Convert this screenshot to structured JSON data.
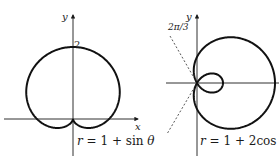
{
  "chart_data": [
    {
      "type": "line",
      "kind": "polar-curve",
      "title": "r = 1 + sin θ",
      "equation": "r = 1 + sin θ",
      "xlabel": "x",
      "ylabel": "y",
      "annotations": [
        {
          "text": "2",
          "at": [
            0,
            2
          ]
        }
      ],
      "curve": "cardioid",
      "theta_range": [
        0,
        6.2832
      ],
      "scale_px_per_unit": 36,
      "origin_px": [
        73,
        119
      ],
      "grid": false
    },
    {
      "type": "line",
      "kind": "polar-curve",
      "title": "r = 1 + 2 cos θ",
      "equation": "r = 1 + 2cos θ",
      "xlabel": "",
      "ylabel": "y",
      "annotations": [
        {
          "text": "2π/3",
          "line_angle": 2.0944,
          "style": "dashed"
        }
      ],
      "curve": "limaçon with inner loop",
      "theta_range": [
        0,
        6.2832
      ],
      "scale_px_per_unit": 26,
      "origin_px": [
        197,
        83
      ],
      "grid": false
    }
  ],
  "left": {
    "y_label": "y",
    "x_label": "x",
    "tick_label": "2",
    "equation": {
      "r": "r",
      "rest": " = 1 + sin ",
      "theta": "θ"
    }
  },
  "right": {
    "y_label": "y",
    "angle_label": "2π/3",
    "equation": {
      "r": "r",
      "rest": " = 1 + 2cos ",
      "theta": "θ"
    }
  }
}
